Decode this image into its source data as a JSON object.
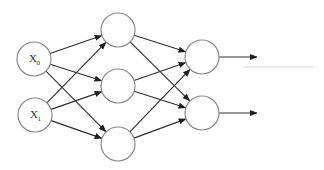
{
  "diagram": {
    "colors": {
      "node_stroke": "#8a8a8a",
      "edge": "#2e2e2e",
      "background": "#ffffff"
    },
    "layers": [
      {
        "name": "input",
        "nodes": [
          {
            "id": "x0",
            "label": "X",
            "subscript": "0",
            "cx": 34,
            "cy": 59,
            "r": 17
          },
          {
            "id": "x1",
            "label": "X",
            "subscript": "1",
            "cx": 35,
            "cy": 115,
            "r": 17
          }
        ]
      },
      {
        "name": "hidden",
        "nodes": [
          {
            "id": "h0",
            "label": "",
            "cx": 118,
            "cy": 30,
            "r": 17
          },
          {
            "id": "h1",
            "label": "",
            "cx": 118,
            "cy": 86,
            "r": 17
          },
          {
            "id": "h2",
            "label": "",
            "cx": 118,
            "cy": 144,
            "r": 17
          }
        ]
      },
      {
        "name": "output",
        "nodes": [
          {
            "id": "o0",
            "label": "",
            "cx": 202,
            "cy": 57,
            "r": 17
          },
          {
            "id": "o1",
            "label": "",
            "cx": 202,
            "cy": 113,
            "r": 17
          }
        ]
      }
    ],
    "edges": [
      {
        "from": "x0",
        "to": "h0"
      },
      {
        "from": "x0",
        "to": "h1"
      },
      {
        "from": "x0",
        "to": "h2"
      },
      {
        "from": "x1",
        "to": "h0"
      },
      {
        "from": "x1",
        "to": "h1"
      },
      {
        "from": "x1",
        "to": "h2"
      },
      {
        "from": "h0",
        "to": "o0"
      },
      {
        "from": "h0",
        "to": "o1"
      },
      {
        "from": "h1",
        "to": "o0"
      },
      {
        "from": "h1",
        "to": "o1"
      },
      {
        "from": "h2",
        "to": "o0"
      },
      {
        "from": "h2",
        "to": "o1"
      }
    ],
    "outputs": [
      {
        "from": "o0",
        "x2": 257
      },
      {
        "from": "o1",
        "x2": 257
      }
    ]
  }
}
